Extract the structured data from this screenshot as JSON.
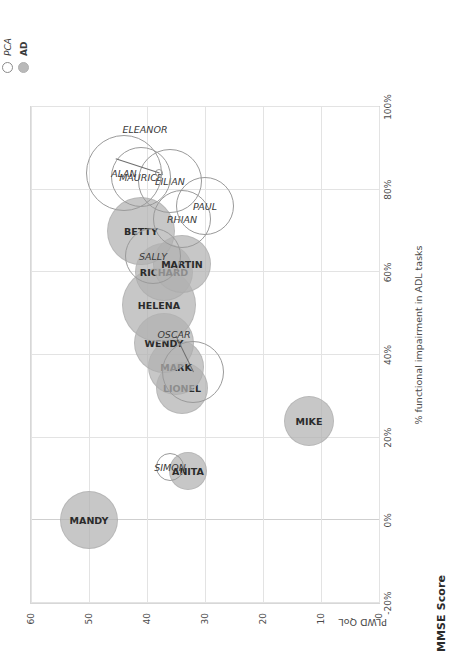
{
  "figure": {
    "mmse_title": "MMSE Score",
    "y_axis_title": "PLWD QoL x % functional impairment in ADL tasks x (inverted) MMSE",
    "y_axis_inner_label": "PLWD QoL",
    "x_axis_title": "% functional impairment in ADL tasks",
    "note": "Note. Marker size corresponds to level of cognitive impairment as indicated by MMSE score. AD = Alzheimer's disease; ADL = activities"
  },
  "legend": {
    "position": "top-right",
    "items": [
      {
        "label": "PCA",
        "style": "open-circle",
        "color": "#8a8a8a"
      },
      {
        "label": "AD",
        "style": "filled-circle",
        "color": "#b9b9b9"
      }
    ]
  },
  "chart_data": {
    "type": "scatter",
    "title": "MMSE Score",
    "xlabel": "% functional impairment in ADL tasks",
    "ylabel": "PLWD QoL",
    "xlim": [
      -20,
      100
    ],
    "ylim": [
      0,
      60
    ],
    "x_ticks": [
      "-20%",
      "0%",
      "20%",
      "40%",
      "60%",
      "80%",
      "100%"
    ],
    "x_tick_values": [
      -20,
      0,
      20,
      40,
      60,
      80,
      100
    ],
    "y_ticks": [
      "0",
      "10",
      "20",
      "30",
      "40",
      "50",
      "60"
    ],
    "y_tick_values": [
      0,
      10,
      20,
      30,
      40,
      50,
      60
    ],
    "grid": true,
    "size_meaning": "Marker size corresponds to level of cognitive impairment as indicated by MMSE score",
    "series": [
      {
        "name": "AD",
        "marker": "filled-circle",
        "color": "#b2b2b2",
        "points": [
          {
            "label": "MANDY",
            "x": 0,
            "y": 50,
            "size": 58
          },
          {
            "label": "ANITA",
            "x": 12,
            "y": 33,
            "size": 38
          },
          {
            "label": "MIKE",
            "x": 24,
            "y": 12,
            "size": 50
          },
          {
            "label": "LIONEL",
            "x": 32,
            "y": 34,
            "size": 52
          },
          {
            "label": "MARK",
            "x": 37,
            "y": 35,
            "size": 56
          },
          {
            "label": "WENDY",
            "x": 43,
            "y": 37,
            "size": 60
          },
          {
            "label": "HELENA",
            "x": 52,
            "y": 38,
            "size": 74
          },
          {
            "label": "RICHARD",
            "x": 60,
            "y": 37,
            "size": 58
          },
          {
            "label": "MARTIN",
            "x": 62,
            "y": 34,
            "size": 58
          },
          {
            "label": "BETTY",
            "x": 70,
            "y": 41,
            "size": 68
          }
        ]
      },
      {
        "name": "PCA",
        "marker": "open-circle",
        "color": "#9a9a9a",
        "points": [
          {
            "label": "SIMON",
            "x": 13,
            "y": 36,
            "size": 28
          },
          {
            "label": "OSCAR",
            "x": 36,
            "y": 32,
            "size": 62,
            "leader": true
          },
          {
            "label": "SALLY",
            "x": 64,
            "y": 39,
            "size": 56
          },
          {
            "label": "RHIAN",
            "x": 73,
            "y": 34,
            "size": 58
          },
          {
            "label": "PAUL",
            "x": 76,
            "y": 30,
            "size": 58
          },
          {
            "label": "LILIAN",
            "x": 82,
            "y": 36,
            "size": 64
          },
          {
            "label": "MAURICE",
            "x": 83,
            "y": 41,
            "size": 60
          },
          {
            "label": "ALAN",
            "x": 84,
            "y": 44,
            "size": 76
          },
          {
            "label": "ELEANOR",
            "x": 84,
            "y": 38,
            "size": 8,
            "leader": true
          }
        ]
      }
    ]
  }
}
